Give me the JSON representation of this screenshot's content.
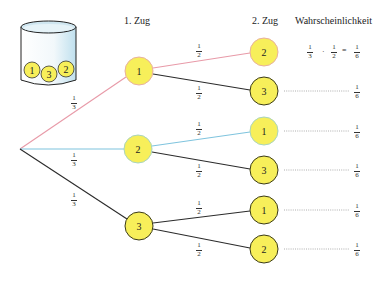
{
  "headers": {
    "first_draw": "1. Zug",
    "second_draw": "2. Zug",
    "probability": "Wahrscheinlichkeit"
  },
  "urn": {
    "balls": [
      "1",
      "3",
      "2"
    ]
  },
  "colors": {
    "red_branch": "#e89aa8",
    "blue_branch": "#7fc4de",
    "black_branch": "#2b2b2b",
    "node_fill": "#f7ef5a",
    "node_border_red": "#e8a0a8",
    "node_border_blue": "#9cd0c8",
    "node_border_dark": "#3a3a1a"
  },
  "tree": {
    "first_level": [
      {
        "label": "1",
        "prob_num": "1",
        "prob_den": "3"
      },
      {
        "label": "2",
        "prob_num": "1",
        "prob_den": "3"
      },
      {
        "label": "3",
        "prob_num": "1",
        "prob_den": "3"
      }
    ],
    "second_level": [
      {
        "label": "2",
        "prob_num": "1",
        "prob_den": "2",
        "result_num": "1",
        "result_den": "6"
      },
      {
        "label": "3",
        "prob_num": "1",
        "prob_den": "2",
        "result_num": "1",
        "result_den": "6"
      },
      {
        "label": "1",
        "prob_num": "1",
        "prob_den": "2",
        "result_num": "1",
        "result_den": "6"
      },
      {
        "label": "3",
        "prob_num": "1",
        "prob_den": "2",
        "result_num": "1",
        "result_den": "6"
      },
      {
        "label": "1",
        "prob_num": "1",
        "prob_den": "2",
        "result_num": "1",
        "result_den": "6"
      },
      {
        "label": "2",
        "prob_num": "1",
        "prob_den": "2",
        "result_num": "1",
        "result_den": "6"
      }
    ]
  },
  "formula": {
    "a_num": "1",
    "a_den": "3",
    "dot": "·",
    "b_num": "1",
    "b_den": "2",
    "equals": "=",
    "c_num": "1",
    "c_den": "6"
  }
}
